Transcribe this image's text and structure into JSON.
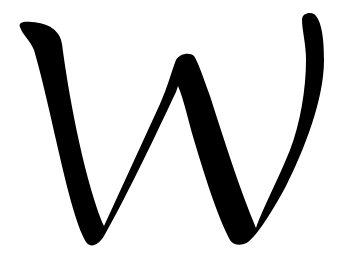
{
  "figure": {
    "glyph": "W",
    "colors": {
      "background": "#ffffff",
      "ink": "#000000"
    }
  }
}
